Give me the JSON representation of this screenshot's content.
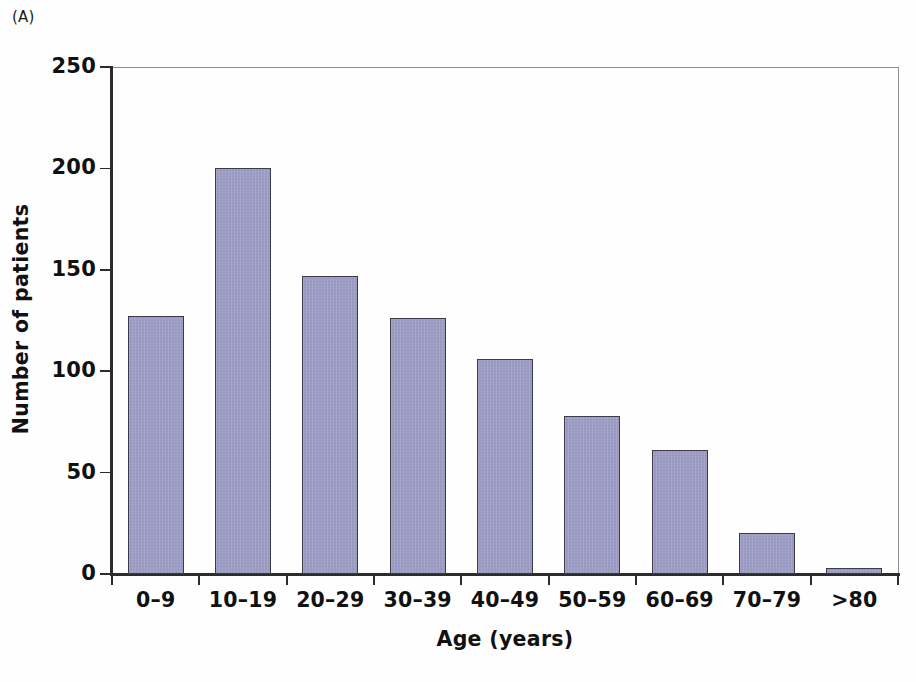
{
  "panel": {
    "label": "(A)"
  },
  "axes": {
    "y_title": "Number of patients",
    "x_title": "Age (years)",
    "y_ticks": [
      "0",
      "50",
      "100",
      "150",
      "200",
      "250"
    ],
    "x_ticks": [
      "0–9",
      "10–19",
      "20–29",
      "30–39",
      "40–49",
      "50–59",
      "60–69",
      "70–79",
      ">80"
    ]
  },
  "style": {
    "bar_fill": "#9c9cc4",
    "bar_border": "#3b3b4a",
    "axis_color": "#2c2c2c",
    "frame_color": "#8f8f8a",
    "background": "#ffffff",
    "text_color": "#111111"
  },
  "chart_data": {
    "type": "bar",
    "title": "",
    "subtitle": "",
    "panel_label": "(A)",
    "xlabel": "Age (years)",
    "ylabel": "Number of patients",
    "categories": [
      "0–9",
      "10–19",
      "20–29",
      "30–39",
      "40–49",
      "50–59",
      "60–69",
      "70–79",
      ">80"
    ],
    "values": [
      127,
      200,
      147,
      126,
      106,
      78,
      61,
      20,
      3
    ],
    "ylim": [
      0,
      250
    ],
    "ytick_values": [
      0,
      50,
      100,
      150,
      200,
      250
    ],
    "grid": false,
    "legend": null,
    "legend_position": "none",
    "annotations": [],
    "series": [
      {
        "name": "Number of patients",
        "values": [
          127,
          200,
          147,
          126,
          106,
          78,
          61,
          20,
          3
        ]
      }
    ]
  }
}
